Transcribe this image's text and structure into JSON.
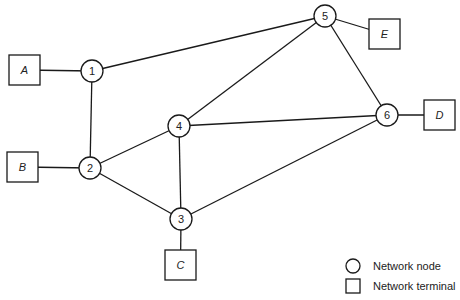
{
  "diagram": {
    "type": "network-topology",
    "nodes": [
      {
        "id": "1",
        "label": "1",
        "kind": "network-node"
      },
      {
        "id": "2",
        "label": "2",
        "kind": "network-node"
      },
      {
        "id": "3",
        "label": "3",
        "kind": "network-node"
      },
      {
        "id": "4",
        "label": "4",
        "kind": "network-node"
      },
      {
        "id": "5",
        "label": "5",
        "kind": "network-node"
      },
      {
        "id": "6",
        "label": "6",
        "kind": "network-node"
      }
    ],
    "terminals": [
      {
        "id": "A",
        "label": "A",
        "attached_to": "1"
      },
      {
        "id": "B",
        "label": "B",
        "attached_to": "2"
      },
      {
        "id": "C",
        "label": "C",
        "attached_to": "3"
      },
      {
        "id": "D",
        "label": "D",
        "attached_to": "6"
      },
      {
        "id": "E",
        "label": "E",
        "attached_to": "5"
      }
    ],
    "links": [
      [
        "1",
        "5"
      ],
      [
        "1",
        "2"
      ],
      [
        "2",
        "4"
      ],
      [
        "2",
        "3"
      ],
      [
        "4",
        "5"
      ],
      [
        "4",
        "6"
      ],
      [
        "4",
        "3"
      ],
      [
        "5",
        "6"
      ],
      [
        "3",
        "6"
      ]
    ]
  },
  "legend": {
    "items": [
      {
        "symbol": "circle",
        "label": "Network node"
      },
      {
        "symbol": "square",
        "label": "Network terminal"
      }
    ]
  }
}
